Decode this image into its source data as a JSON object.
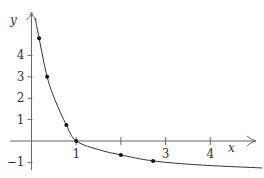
{
  "chart_data": {
    "type": "line",
    "title": "",
    "xlabel": "x",
    "ylabel": "y",
    "xlim": [
      -0.5,
      5.2
    ],
    "ylim": [
      -1.5,
      6.2
    ],
    "grid": false,
    "legend": null,
    "x_ticks": [
      {
        "value": 1,
        "label": "1"
      },
      {
        "value": 2,
        "label": ""
      },
      {
        "value": 3,
        "label": "3"
      },
      {
        "value": 4,
        "label": "4"
      }
    ],
    "y_ticks": [
      {
        "value": -1,
        "label": "−1"
      },
      {
        "value": 1,
        "label": "1"
      },
      {
        "value": 2,
        "label": "2"
      },
      {
        "value": 3,
        "label": "3"
      },
      {
        "value": 4,
        "label": "4"
      }
    ],
    "series": [
      {
        "name": "curve",
        "x": [
          0.08,
          0.17,
          0.35,
          0.53,
          0.78,
          1.0,
          1.53,
          2.0,
          2.72,
          3.77,
          5.16
        ],
        "y": [
          5.75,
          4.8,
          3.0,
          1.9,
          0.75,
          0.0,
          -0.42,
          -0.65,
          -0.93,
          -1.12,
          -1.26
        ]
      }
    ],
    "points": {
      "x": [
        0.17,
        0.35,
        0.78,
        1.0,
        2.0,
        2.72
      ],
      "y": [
        4.8,
        3.0,
        0.75,
        0.0,
        -0.65,
        -0.93
      ]
    },
    "colors": {
      "axis": "#555555",
      "curve": "#333333",
      "point": "#111111",
      "text": "#333333"
    }
  }
}
